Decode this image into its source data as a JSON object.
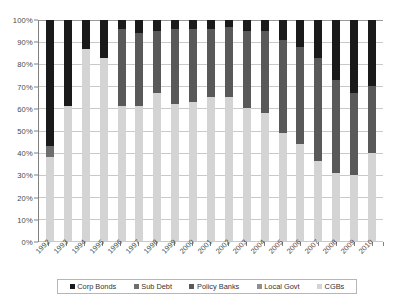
{
  "chart_data": {
    "type": "bar",
    "subtype": "stacked-100-percent",
    "title": "",
    "xlabel": "",
    "ylabel": "",
    "ylim": [
      0,
      100
    ],
    "ytick_labels": [
      "0%",
      "10%",
      "20%",
      "30%",
      "40%",
      "50%",
      "60%",
      "70%",
      "80%",
      "90%",
      "100%"
    ],
    "ytick_values": [
      0,
      10,
      20,
      30,
      40,
      50,
      60,
      70,
      80,
      90,
      100
    ],
    "grid": true,
    "legend_position": "bottom",
    "categories": [
      "1992",
      "1993",
      "1994",
      "1995",
      "1996",
      "1997",
      "1998",
      "1999",
      "2000",
      "2001",
      "2002",
      "2003",
      "2004",
      "2005",
      "2006",
      "2007",
      "2008",
      "2009",
      "2010"
    ],
    "series": [
      {
        "name": "CGBs",
        "color": "#d4d4d4",
        "values": [
          38,
          61,
          87,
          83,
          61,
          61,
          67,
          62,
          63,
          65,
          65,
          60,
          58,
          49,
          44,
          36,
          31,
          30,
          40
        ]
      },
      {
        "name": "Local Govt",
        "color": "#8f8f8f",
        "values": [
          0,
          0,
          0,
          0,
          0,
          0,
          0,
          0,
          0,
          0,
          0,
          0,
          0,
          0,
          0,
          0,
          0,
          0,
          0
        ]
      },
      {
        "name": "Policy Banks",
        "color": "#595959",
        "values": [
          0,
          0,
          0,
          0,
          35,
          33,
          28,
          34,
          33,
          31,
          32,
          35,
          37,
          42,
          44,
          47,
          42,
          37,
          30
        ]
      },
      {
        "name": "Sub Debt",
        "color": "#6e6e6e",
        "values": [
          5,
          0,
          0,
          0,
          0,
          0,
          0,
          0,
          0,
          0,
          0,
          0,
          0,
          0,
          0,
          0,
          0,
          0,
          0
        ]
      },
      {
        "name": "Corp Bonds",
        "color": "#1a1a1a",
        "values": [
          57,
          39,
          13,
          17,
          4,
          6,
          5,
          4,
          4,
          4,
          3,
          5,
          5,
          9,
          12,
          17,
          27,
          33,
          30
        ]
      }
    ],
    "legend_entries": [
      {
        "label": "Corp Bonds",
        "color": "#1a1a1a"
      },
      {
        "label": "Sub Debt",
        "color": "#6e6e6e"
      },
      {
        "label": "Policy Banks",
        "color": "#595959"
      },
      {
        "label": "Local Govt",
        "color": "#8f8f8f"
      },
      {
        "label": "CGBs",
        "color": "#d4d4d4"
      }
    ]
  }
}
